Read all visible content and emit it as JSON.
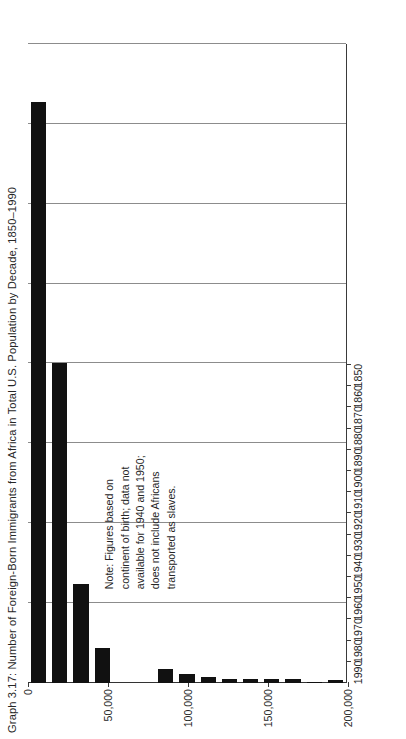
{
  "figure": {
    "title": "Graph 3.17: Number of Foreign-Born Immigrants from Africa in Total U.S. Population by Decade, 1850–1990",
    "note": "Note: Figures based on\ncontinent of birth; data not\navailable for 1940 and 1950;\ndoes not include Africans\ntransported as slaves.",
    "bar_color": "#111111",
    "grid_color": "#8c8c8c",
    "axis_color": "#3a3a3a",
    "background": "#ffffff"
  },
  "chart_data": {
    "type": "bar",
    "title": "Graph 3.17: Number of Foreign-Born Immigrants from Africa in Total U.S. Population by Decade, 1850–1990",
    "xlabel": "",
    "ylabel": "",
    "orientation": "vertical",
    "grid": true,
    "legend": null,
    "ylim": [
      0,
      400000
    ],
    "ytick_labels": [
      "0",
      "50,000",
      "100,000",
      "150,000",
      "200,000",
      "250,000",
      "300,000",
      "350,000",
      "400,000"
    ],
    "yticks": [
      0,
      50000,
      100000,
      150000,
      200000,
      250000,
      300000,
      350000,
      400000
    ],
    "categories": [
      "1850",
      "1860",
      "1870",
      "1880",
      "1890",
      "1900",
      "1910",
      "1920",
      "1930",
      "1940",
      "1950",
      "1960",
      "1970",
      "1980",
      "1990"
    ],
    "values": [
      2000,
      500,
      2700,
      2200,
      2200,
      2500,
      4000,
      5800,
      8900,
      null,
      null,
      22000,
      62000,
      200000,
      364000
    ],
    "annotations": [
      "Note: Figures based on continent of birth; data not available for 1940 and 1950; does not include Africans transported as slaves."
    ]
  }
}
